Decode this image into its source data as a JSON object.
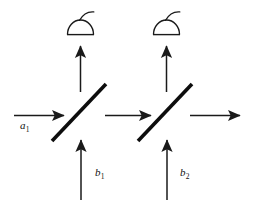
{
  "figure": {
    "background_color": "#ffffff",
    "stroke_color": "#1a1a1a",
    "width": 254,
    "height": 201
  },
  "labels": {
    "a1": {
      "base": "a",
      "sub": "1"
    },
    "b1": {
      "base": "b",
      "sub": "1"
    },
    "b2": {
      "base": "b",
      "sub": "2"
    }
  },
  "elements": {
    "beam_splitter_1": "beam-splitter",
    "beam_splitter_2": "beam-splitter",
    "detector_1": "photodetector",
    "detector_2": "photodetector",
    "input_beam_a1": "horizontal-arrow-right",
    "input_beam_b1": "vertical-arrow-up",
    "input_beam_b2": "vertical-arrow-up",
    "middle_beam": "horizontal-arrow-right",
    "output_beam": "horizontal-arrow-right",
    "detector_beam_1": "vertical-arrow-up",
    "detector_beam_2": "vertical-arrow-up"
  }
}
